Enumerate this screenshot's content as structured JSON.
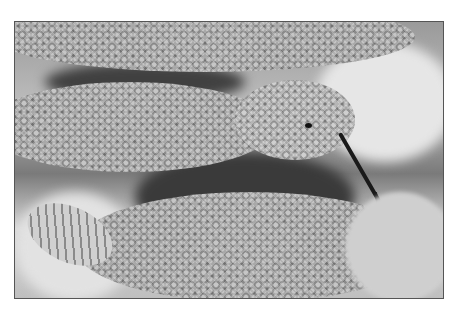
{
  "image": {
    "description": "Black and white photograph of a rattlesnake, coiled, head raised with forked tongue extended, rattle visible at lower left",
    "subject": "rattlesnake",
    "palette": {
      "border": "#555555",
      "background": "#ffffff",
      "light_tone": "#d8d8d8",
      "mid_tone": "#a8a8a8",
      "dark_tone": "#1a1a1a"
    }
  }
}
